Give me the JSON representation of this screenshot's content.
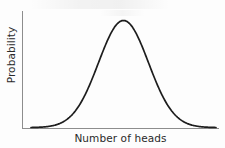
{
  "chart_data": {
    "type": "line",
    "title": "",
    "subtitle": "",
    "xlabel": "Number of heads",
    "ylabel": "Probability",
    "grid": false,
    "legend": null,
    "annotations": [],
    "xticklabels": [],
    "yticklabels": [],
    "xlim": [
      0,
      1
    ],
    "ylim": [
      0,
      1
    ],
    "curve_color": "#1d1d1d",
    "axis_color": "#8d8d8d",
    "background_color": "#fdfdfd",
    "series": [
      {
        "name": "Probability distribution",
        "distribution": "normal",
        "mean": 0.5,
        "std": 0.135,
        "peak_x": 0.5,
        "peak_y": 1.0,
        "x": [
          0.0,
          0.05,
          0.1,
          0.15,
          0.2,
          0.25,
          0.3,
          0.35,
          0.4,
          0.45,
          0.5,
          0.55,
          0.6,
          0.65,
          0.7,
          0.75,
          0.8,
          0.85,
          0.9,
          0.95,
          1.0
        ],
        "values": [
          0.004,
          0.011,
          0.027,
          0.06,
          0.12,
          0.216,
          0.35,
          0.513,
          0.678,
          0.843,
          1.0,
          0.843,
          0.678,
          0.513,
          0.35,
          0.216,
          0.12,
          0.06,
          0.027,
          0.011,
          0.004
        ]
      }
    ]
  },
  "figure": {
    "xaxis_label": "Number of heads",
    "yaxis_label": "Probability"
  }
}
